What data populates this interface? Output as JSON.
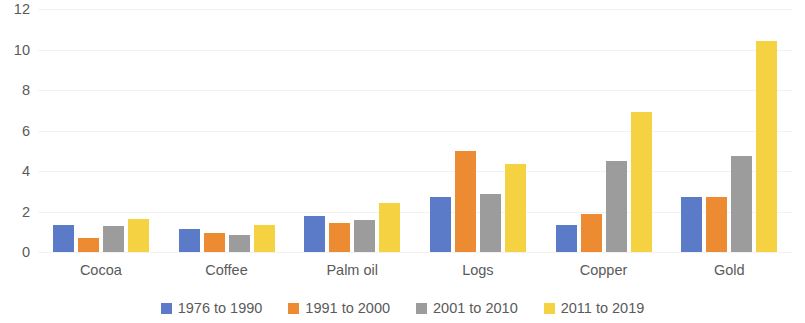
{
  "chart_data": {
    "type": "bar",
    "title": "",
    "subtitle": "",
    "xlabel": "",
    "ylabel": "",
    "ylim": [
      0,
      12
    ],
    "yticks": [
      0,
      2,
      4,
      6,
      8,
      10,
      12
    ],
    "ytick_labels": [
      "0",
      "2",
      "4",
      "6",
      "8",
      "10",
      "12"
    ],
    "grid": true,
    "grid_axis": "y",
    "legend_position": "bottom",
    "categories": [
      "Cocoa",
      "Coffee",
      "Palm oil",
      "Logs",
      "Copper",
      "Gold"
    ],
    "series": [
      {
        "name": "1976 to 1990",
        "color": "#5B7BC8",
        "values": [
          1.35,
          1.15,
          1.8,
          2.7,
          1.35,
          2.7
        ]
      },
      {
        "name": "1991 to 2000",
        "color": "#ED8B33",
        "values": [
          0.7,
          0.95,
          1.45,
          5.0,
          1.9,
          2.7
        ]
      },
      {
        "name": "2001 to 2010",
        "color": "#9C9C9C",
        "values": [
          1.3,
          0.85,
          1.6,
          2.85,
          4.5,
          4.75
        ]
      },
      {
        "name": "2011 to 2019",
        "color": "#F5D242",
        "values": [
          1.65,
          1.35,
          2.4,
          4.35,
          6.9,
          10.4
        ]
      }
    ]
  }
}
